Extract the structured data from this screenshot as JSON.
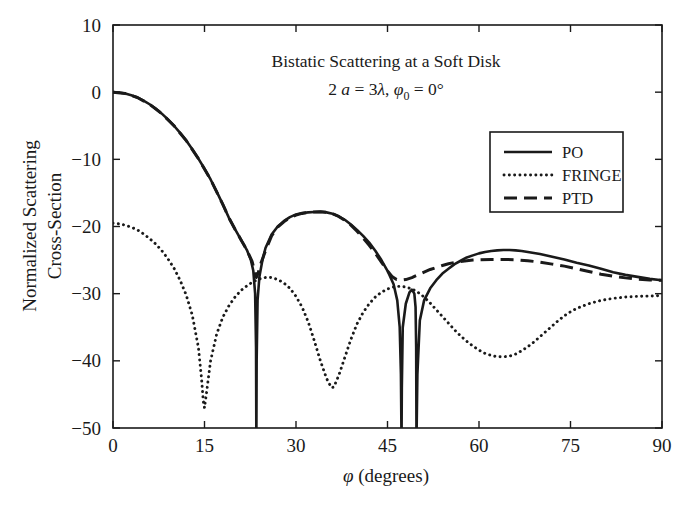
{
  "chart_data": {
    "type": "line",
    "title": "Bistatic Scattering at a Soft Disk",
    "subtitle_plain": "2 a = 3λ, φ₀ = 0°",
    "subtitle_parts": {
      "two": "2",
      "a": "a",
      "eq1": " = 3",
      "lambda": "λ",
      "comma": ", ",
      "phi": "φ",
      "sub0": "0",
      "eq2": " = 0°"
    },
    "xlabel_symbol": "φ",
    "xlabel_rest": " (degrees)",
    "xlabel": "φ (degrees)",
    "ylabel_line1": "Normalized Scattering",
    "ylabel_line2": "Cross-Section",
    "ylabel": "Normalized Scattering Cross-Section",
    "xlim": [
      0,
      90
    ],
    "ylim": [
      -50,
      10
    ],
    "xticks": [
      0,
      15,
      30,
      45,
      60,
      75,
      90
    ],
    "xtick_labels": [
      "0",
      "15",
      "30",
      "45",
      "60",
      "75",
      "90"
    ],
    "yticks": [
      10,
      0,
      -10,
      -20,
      -30,
      -40,
      -50
    ],
    "ytick_labels": [
      "10",
      "0",
      "−10",
      "−20",
      "−30",
      "−40",
      "−50"
    ],
    "grid": false,
    "legend_position": "upper-right-inside",
    "line_color": "#1a1a1a",
    "series": [
      {
        "name": "PO",
        "style": "solid",
        "x": [
          0,
          1,
          2,
          3,
          4,
          5,
          6,
          7,
          8,
          9,
          10,
          11,
          12,
          13,
          14,
          15,
          16,
          17,
          18,
          19,
          20,
          21,
          22,
          22.6,
          23.0,
          23.3,
          23.45,
          23.5,
          23.55,
          23.7,
          24.0,
          24.5,
          25,
          26,
          27,
          28,
          29,
          30,
          31,
          32,
          33,
          34,
          35,
          36,
          37,
          38,
          39,
          40,
          41,
          42,
          43,
          44,
          45,
          46,
          46.6,
          47.0,
          47.2,
          47.3,
          47.35,
          47.5,
          48.0,
          48.6,
          49.0,
          49.4,
          49.6,
          49.7,
          49.75,
          49.9,
          50.3,
          51,
          52,
          53,
          54,
          55,
          56,
          57,
          58,
          59,
          60,
          61,
          62,
          63,
          64,
          65,
          66,
          67,
          68,
          69,
          70,
          72,
          74,
          76,
          78,
          80,
          82,
          84,
          86,
          88,
          90
        ],
        "y": [
          0.0,
          -0.05,
          -0.2,
          -0.45,
          -0.8,
          -1.25,
          -1.8,
          -2.45,
          -3.2,
          -4.05,
          -5.0,
          -6.05,
          -7.2,
          -8.5,
          -9.9,
          -11.4,
          -13.0,
          -14.8,
          -16.7,
          -18.7,
          -20.4,
          -22.0,
          -23.6,
          -25.0,
          -26.6,
          -30.0,
          -38.0,
          -52.0,
          -40.0,
          -31.0,
          -27.5,
          -25.0,
          -23.2,
          -21.2,
          -20.0,
          -19.2,
          -18.6,
          -18.2,
          -18.0,
          -17.9,
          -17.85,
          -17.8,
          -17.9,
          -18.1,
          -18.5,
          -19.0,
          -19.7,
          -20.5,
          -21.4,
          -22.4,
          -23.6,
          -25.0,
          -26.6,
          -28.6,
          -31.0,
          -35.0,
          -42.0,
          -52.0,
          -44.0,
          -35.0,
          -31.5,
          -29.8,
          -29.4,
          -30.0,
          -32.0,
          -38.0,
          -52.0,
          -42.0,
          -34.0,
          -31.0,
          -29.2,
          -28.0,
          -27.0,
          -26.3,
          -25.6,
          -25.1,
          -24.6,
          -24.3,
          -24.0,
          -23.8,
          -23.65,
          -23.55,
          -23.5,
          -23.5,
          -23.55,
          -23.65,
          -23.8,
          -23.95,
          -24.1,
          -24.5,
          -24.9,
          -25.4,
          -25.8,
          -26.3,
          -26.8,
          -27.2,
          -27.5,
          -27.8,
          -28.0
        ]
      },
      {
        "name": "FRINGE",
        "style": "dotted",
        "x": [
          0,
          1,
          2,
          3,
          4,
          5,
          6,
          7,
          8,
          9,
          10,
          11,
          12,
          13,
          14,
          14.5,
          14.8,
          15,
          15.3,
          16,
          17,
          18,
          19,
          20,
          21,
          22,
          23,
          24,
          25,
          26,
          27,
          28,
          29,
          30,
          31,
          32,
          33,
          34,
          35,
          35.8,
          36.2,
          37,
          38,
          39,
          40,
          41,
          42,
          43,
          44,
          45,
          46,
          47,
          48,
          49,
          50,
          51,
          52,
          53,
          54,
          55,
          56,
          57,
          58,
          59,
          60,
          61,
          62,
          63,
          64,
          65,
          66,
          67,
          68,
          69,
          70,
          71,
          72,
          73,
          74,
          75,
          76,
          78,
          80,
          82,
          84,
          86,
          88,
          90
        ],
        "y": [
          -19.5,
          -19.6,
          -19.8,
          -20.1,
          -20.5,
          -21.1,
          -21.8,
          -22.6,
          -23.6,
          -24.8,
          -26.2,
          -28.0,
          -30.2,
          -33.2,
          -38.0,
          -42.5,
          -46.0,
          -47.0,
          -45.0,
          -40.0,
          -36.0,
          -33.5,
          -31.8,
          -30.5,
          -29.5,
          -28.8,
          -28.2,
          -27.8,
          -27.6,
          -27.6,
          -27.9,
          -28.4,
          -29.2,
          -30.4,
          -32.0,
          -34.2,
          -37.0,
          -40.0,
          -42.6,
          -44.0,
          -43.9,
          -42.2,
          -39.5,
          -36.8,
          -34.5,
          -32.8,
          -31.5,
          -30.5,
          -29.8,
          -29.3,
          -29.0,
          -28.9,
          -29.0,
          -29.3,
          -29.8,
          -30.5,
          -31.4,
          -32.4,
          -33.4,
          -34.4,
          -35.4,
          -36.3,
          -37.1,
          -37.8,
          -38.4,
          -38.9,
          -39.2,
          -39.4,
          -39.4,
          -39.3,
          -39.0,
          -38.5,
          -37.9,
          -37.2,
          -36.4,
          -35.6,
          -34.8,
          -34.0,
          -33.3,
          -32.7,
          -32.2,
          -31.5,
          -31.0,
          -30.7,
          -30.5,
          -30.4,
          -30.35,
          -30.3
        ]
      },
      {
        "name": "PTD",
        "style": "dashed",
        "x": [
          0,
          2,
          4,
          6,
          8,
          10,
          12,
          14,
          16,
          18,
          19,
          20,
          21,
          22,
          22.8,
          23.2,
          23.5,
          23.8,
          24.2,
          25,
          26,
          27,
          28,
          29,
          30,
          31,
          32,
          33,
          34,
          35,
          36,
          37,
          38,
          39,
          40,
          41,
          42,
          43,
          44,
          45,
          45.8,
          46.5,
          47.2,
          48,
          49,
          50,
          51,
          52,
          53,
          54,
          55,
          56,
          57,
          58,
          59,
          60,
          62,
          64,
          66,
          68,
          70,
          72,
          74,
          76,
          78,
          80,
          82,
          84,
          86,
          88,
          90
        ],
        "y": [
          0.0,
          -0.2,
          -0.8,
          -1.8,
          -3.2,
          -5.0,
          -7.2,
          -9.9,
          -13.0,
          -16.7,
          -18.7,
          -20.4,
          -22.0,
          -23.6,
          -25.2,
          -26.6,
          -27.6,
          -26.9,
          -25.6,
          -23.6,
          -21.4,
          -20.1,
          -19.3,
          -18.7,
          -18.3,
          -18.05,
          -17.9,
          -17.85,
          -17.8,
          -17.9,
          -18.1,
          -18.5,
          -19.1,
          -19.8,
          -20.7,
          -21.7,
          -22.8,
          -24.0,
          -25.3,
          -26.6,
          -27.5,
          -27.9,
          -28.0,
          -27.9,
          -27.6,
          -27.2,
          -26.8,
          -26.4,
          -26.1,
          -25.8,
          -25.55,
          -25.35,
          -25.2,
          -25.1,
          -25.0,
          -24.95,
          -24.9,
          -24.9,
          -24.95,
          -25.1,
          -25.3,
          -25.6,
          -25.9,
          -26.3,
          -26.7,
          -27.1,
          -27.4,
          -27.65,
          -27.85,
          -27.95,
          -28.0
        ]
      }
    ]
  }
}
